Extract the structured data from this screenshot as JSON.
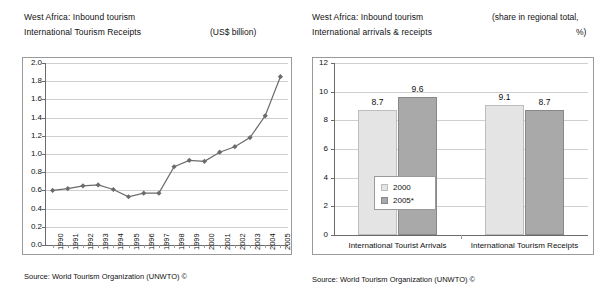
{
  "left_panel": {
    "title_line1": "West Africa: Inbound tourism",
    "title_line2": "International Tourism Receipts",
    "unit_note": "(US$ billion)",
    "source": "Source: World Tourism Organization (UNWTO) ©"
  },
  "right_panel": {
    "title_line1": "West Africa: Inbound tourism",
    "title_line2": "International arrivals & receipts",
    "unit_note_line1": "(share in regional total,",
    "unit_note_line2": "%)",
    "source": "Source: World Tourism Organization (UNWTO) ©"
  },
  "chart_data": [
    {
      "type": "line",
      "title": "West Africa: Inbound tourism — International Tourism Receipts",
      "xlabel": "",
      "ylabel": "(US$ billion)",
      "x": [
        "1990",
        "1991",
        "1992",
        "1993",
        "1994",
        "1995",
        "1996",
        "1997",
        "1998",
        "1999",
        "2000",
        "2001",
        "2002",
        "2003",
        "2004",
        "2005"
      ],
      "values": [
        0.6,
        0.62,
        0.65,
        0.66,
        0.61,
        0.53,
        0.57,
        0.57,
        0.86,
        0.93,
        0.92,
        1.02,
        1.08,
        1.18,
        1.42,
        1.85
      ],
      "ylim": [
        0.0,
        2.0
      ],
      "yticks": [
        "0.0",
        "0.2",
        "0.4",
        "0.6",
        "0.8",
        "1.0",
        "1.2",
        "1.4",
        "1.6",
        "1.8",
        "2.0"
      ],
      "grid": true,
      "marker": "diamond",
      "series_color": "#6b6b6b",
      "legend": null
    },
    {
      "type": "bar",
      "title": "West Africa: Inbound tourism — International arrivals & receipts",
      "xlabel": "",
      "ylabel": "(share in regional total, %)",
      "categories": [
        "International Tourist Arrivals",
        "International Tourism Receipts"
      ],
      "series": [
        {
          "name": "2000",
          "values": [
            8.7,
            9.1
          ],
          "color": "#e4e4e4"
        },
        {
          "name": "2005*",
          "values": [
            9.6,
            8.7
          ],
          "color": "#a9a9a9"
        }
      ],
      "data_labels": [
        "8.7",
        "9.6",
        "9.1",
        "8.7"
      ],
      "ylim": [
        0,
        12
      ],
      "yticks": [
        "0",
        "2",
        "4",
        "6",
        "8",
        "10",
        "12"
      ],
      "grid": true,
      "legend_position": "inside-left"
    }
  ]
}
